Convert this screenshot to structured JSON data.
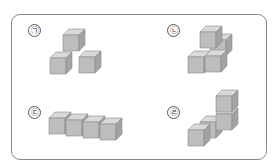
{
  "figures": [
    {
      "label": "㉠",
      "description": "4 cubes: 3 on bottom in L shape, 1 on top"
    },
    {
      "label": "㉡",
      "description": "4 cubes: 3 on bottom in row, 1 on top center"
    },
    {
      "label": "㉢",
      "description": "4 cubes in a straight row"
    },
    {
      "label": "㉣",
      "description": "4 cubes: 2 stacked at right back, 2 on bottom"
    }
  ],
  "colors": {
    "top": "#d9d9d9",
    "front": "#bdbdbd",
    "side": "#a3a3a3",
    "edge": "#8c8c8c",
    "border": "#8a8a8a"
  }
}
